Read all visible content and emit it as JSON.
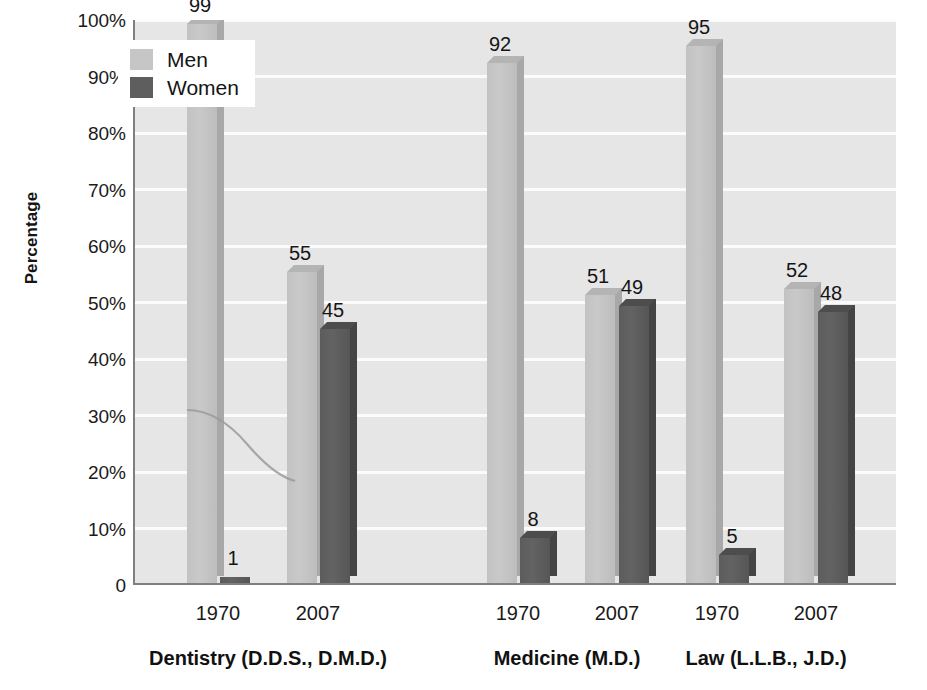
{
  "chart_data": {
    "type": "bar",
    "title": "",
    "xlabel": "",
    "ylabel": "Percentage",
    "ylim": [
      0,
      100
    ],
    "grid": true,
    "legend_position": "top-left-inside",
    "categories": [
      "Dentistry (D.D.S., D.M.D.) 1970",
      "Dentistry (D.D.S., D.M.D.) 2007",
      "Medicine (M.D.) 1970",
      "Medicine (M.D.) 2007",
      "Law (L.L.B., J.D.) 1970",
      "Law (L.L.B., J.D.) 2007"
    ],
    "series": [
      {
        "name": "Men",
        "color": "#c6c6c6",
        "values": [
          99,
          55,
          92,
          51,
          95,
          52
        ]
      },
      {
        "name": "Women",
        "color": "#5e5e5e",
        "values": [
          1,
          45,
          8,
          49,
          5,
          48
        ]
      }
    ],
    "y_ticks": [
      "0",
      "10%",
      "20%",
      "30%",
      "40%",
      "50%",
      "60%",
      "70%",
      "80%",
      "90%",
      "100%"
    ],
    "groups": [
      {
        "field": "Dentistry (D.D.S., D.M.D.)",
        "years": [
          "1970",
          "2007"
        ]
      },
      {
        "field": "Medicine (M.D.)",
        "years": [
          "1970",
          "2007"
        ]
      },
      {
        "field": "Law (L.L.B., J.D.)",
        "years": [
          "1970",
          "2007"
        ]
      }
    ],
    "annotations": [
      {
        "kind": "curve",
        "description": "faint trend curve descending from ~31% to ~21% across the Dentistry group"
      }
    ]
  },
  "axis": {
    "y_title": "Percentage",
    "ticks": [
      {
        "label": "100%",
        "value": 100
      },
      {
        "label": "90%",
        "value": 90
      },
      {
        "label": "80%",
        "value": 80
      },
      {
        "label": "70%",
        "value": 70
      },
      {
        "label": "60%",
        "value": 60
      },
      {
        "label": "50%",
        "value": 50
      },
      {
        "label": "40%",
        "value": 40
      },
      {
        "label": "30%",
        "value": 30
      },
      {
        "label": "20%",
        "value": 20
      },
      {
        "label": "10%",
        "value": 10
      },
      {
        "label": "0",
        "value": 0
      }
    ]
  },
  "legend": {
    "items": [
      {
        "label": "Men",
        "color": "#c6c6c6"
      },
      {
        "label": "Women",
        "color": "#5e5e5e"
      }
    ]
  },
  "bars": [
    {
      "label": "99",
      "value": 99,
      "series": "Men",
      "group": "Dentistry (D.D.S., D.M.D.)",
      "year": "1970"
    },
    {
      "label": "1",
      "value": 1,
      "series": "Women",
      "group": "Dentistry (D.D.S., D.M.D.)",
      "year": "1970"
    },
    {
      "label": "55",
      "value": 55,
      "series": "Men",
      "group": "Dentistry (D.D.S., D.M.D.)",
      "year": "2007"
    },
    {
      "label": "45",
      "value": 45,
      "series": "Women",
      "group": "Dentistry (D.D.S., D.M.D.)",
      "year": "2007"
    },
    {
      "label": "92",
      "value": 92,
      "series": "Men",
      "group": "Medicine (M.D.)",
      "year": "1970"
    },
    {
      "label": "8",
      "value": 8,
      "series": "Women",
      "group": "Medicine (M.D.)",
      "year": "1970"
    },
    {
      "label": "51",
      "value": 51,
      "series": "Men",
      "group": "Medicine (M.D.)",
      "year": "2007"
    },
    {
      "label": "49",
      "value": 49,
      "series": "Women",
      "group": "Medicine (M.D.)",
      "year": "2007"
    },
    {
      "label": "95",
      "value": 95,
      "series": "Men",
      "group": "Law (L.L.B., J.D.)",
      "year": "1970"
    },
    {
      "label": "5",
      "value": 5,
      "series": "Women",
      "group": "Law (L.L.B., J.D.)",
      "year": "1970"
    },
    {
      "label": "52",
      "value": 52,
      "series": "Men",
      "group": "Law (L.L.B., J.D.)",
      "year": "2007"
    },
    {
      "label": "48",
      "value": 48,
      "series": "Women",
      "group": "Law (L.L.B., J.D.)",
      "year": "2007"
    }
  ],
  "x_axis": {
    "years": [
      "1970",
      "2007",
      "1970",
      "2007",
      "1970",
      "2007"
    ],
    "group_labels": [
      "Dentistry (D.D.S., D.M.D.)",
      "Medicine (M.D.)",
      "Law (L.L.B., J.D.)"
    ]
  },
  "colors": {
    "men": "#c6c6c6",
    "women": "#5e5e5e",
    "plot_background": "#e6e6e6",
    "gridline": "#fbfbfb",
    "axis": "#7f7f7f",
    "text": "#1a1a1a"
  }
}
